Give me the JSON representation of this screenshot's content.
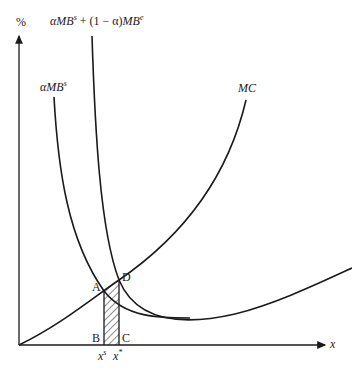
{
  "diagram": {
    "y_axis_label": "%",
    "x_axis_label": "x",
    "curves": {
      "combined_label_alpha": "α",
      "combined_label_mb1": "MB",
      "combined_label_sup1": "s",
      "combined_label_mid": " + (1 − α)",
      "combined_label_mb2": "MB",
      "combined_label_sup2": "e",
      "private_label_alpha": "α",
      "private_label_mb": "MB",
      "private_label_sup": "s",
      "mc_label": "MC"
    },
    "points": {
      "A": "A",
      "B": "B",
      "C": "C",
      "D": "D"
    },
    "ticks": {
      "xs_base": "x",
      "xs_sup": "s",
      "xstar_base": "x",
      "xstar_sup": "*"
    },
    "colors": {
      "line": "#1a1a1a",
      "hatch": "#333333"
    }
  }
}
